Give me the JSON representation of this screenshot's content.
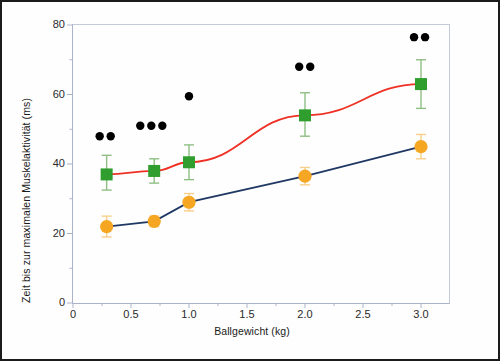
{
  "chart_data": {
    "type": "scatter",
    "title": "",
    "xlabel": "Ballgewicht (kg)",
    "ylabel": "Zeit bis zur maximalen Muskelaktivität (ms)",
    "xlim": [
      0,
      3.25
    ],
    "ylim": [
      0,
      80
    ],
    "xticks": [
      "0",
      "0.5",
      "1.0",
      "1.5",
      "2.0",
      "2.5",
      "3.0"
    ],
    "xtick_values": [
      0,
      0.5,
      1.0,
      1.5,
      2.0,
      2.5,
      3.0
    ],
    "yticks": [
      "0",
      "20",
      "40",
      "60",
      "80"
    ],
    "ytick_values": [
      0,
      20,
      40,
      60,
      80
    ],
    "y_minor_ticks": [
      10,
      30,
      50,
      70
    ],
    "grid": false,
    "legend": "none",
    "colors": {
      "series_green": "#2f9e2f",
      "series_green_fit": "#ee3124",
      "series_orange": "#f5a623",
      "series_orange_fit": "#1f3864",
      "significance_marker": "#000000",
      "axis": "#aab4c8",
      "frame": "#1b1b1b"
    },
    "series": [
      {
        "name": "green-squares",
        "marker": "square",
        "marker_color": "#2f9e2f",
        "fit_line_color": "#ee3124",
        "fit_line_type": "curve",
        "x": [
          0.29,
          0.7,
          1.0,
          2.0,
          3.0
        ],
        "values": [
          37,
          38,
          40.5,
          54,
          63
        ],
        "err_low": [
          4.5,
          3.5,
          5.0,
          6.0,
          7.0
        ],
        "err_high": [
          5.5,
          3.5,
          5.0,
          6.5,
          7.0
        ]
      },
      {
        "name": "orange-circles",
        "marker": "circle",
        "marker_color": "#f5a623",
        "fit_line_color": "#1f3864",
        "fit_line_type": "line",
        "x": [
          0.29,
          0.7,
          1.0,
          2.0,
          3.0
        ],
        "values": [
          22,
          23.5,
          29,
          36.5,
          45
        ],
        "err_low": [
          3.0,
          1.5,
          2.5,
          2.5,
          3.5
        ],
        "err_high": [
          3.0,
          1.5,
          2.5,
          2.5,
          3.5
        ]
      }
    ],
    "significance_markers": [
      {
        "x": 0.23,
        "y": 48,
        "count": 2,
        "spacing_kg": 0.095
      },
      {
        "x": 0.58,
        "y": 51,
        "count": 3,
        "spacing_kg": 0.095
      },
      {
        "x": 1.0,
        "y": 59.5,
        "count": 1,
        "spacing_kg": 0.095
      },
      {
        "x": 1.95,
        "y": 68,
        "count": 2,
        "spacing_kg": 0.095
      },
      {
        "x": 2.94,
        "y": 76.5,
        "count": 2,
        "spacing_kg": 0.095
      }
    ]
  }
}
